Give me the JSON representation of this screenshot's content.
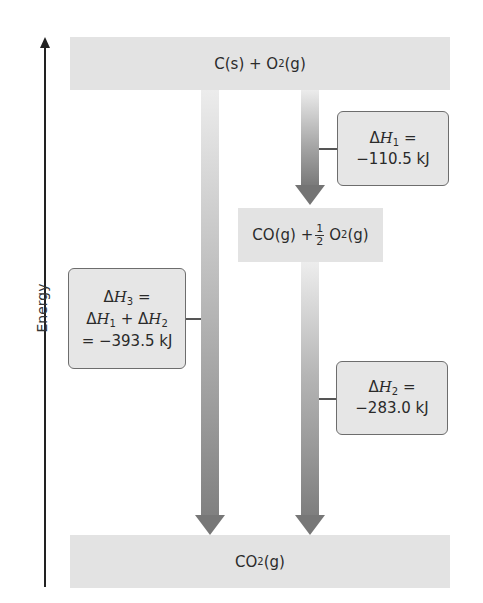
{
  "axis": {
    "label": "Energy"
  },
  "levels": {
    "top": {
      "species": "C(s) + O",
      "sub": "2",
      "state": "(g)"
    },
    "middle": {
      "species_a": "CO(g) +",
      "frac_num": "1",
      "frac_den": "2",
      "species_b": "O",
      "sub": "2",
      "state": "(g)"
    },
    "bottom": {
      "species": "CO",
      "sub": "2",
      "state": "(g)"
    }
  },
  "callouts": {
    "h1": {
      "delta": "Δ",
      "symbol": "H",
      "sub": "1",
      "eq": " =",
      "value": "−110.5 kJ"
    },
    "h2": {
      "delta": "Δ",
      "symbol": "H",
      "sub": "2",
      "eq": " =",
      "value": "−283.0 kJ"
    },
    "h3": {
      "line1": {
        "delta": "Δ",
        "symbol": "H",
        "sub": "3",
        "eq": " ="
      },
      "line2": {
        "delta1": "Δ",
        "symbol1": "H",
        "sub1": "1",
        "plus": " + ",
        "delta2": "Δ",
        "symbol2": "H",
        "sub2": "2"
      },
      "line3": "= −393.5 kJ"
    }
  },
  "colors": {
    "level_fill": "#e3e3e3",
    "callout_fill": "#e6e6e6",
    "callout_border": "#6d6d6d",
    "arrow_dark": "#777777",
    "arrow_light": "#ececec",
    "axis": "#222222"
  }
}
